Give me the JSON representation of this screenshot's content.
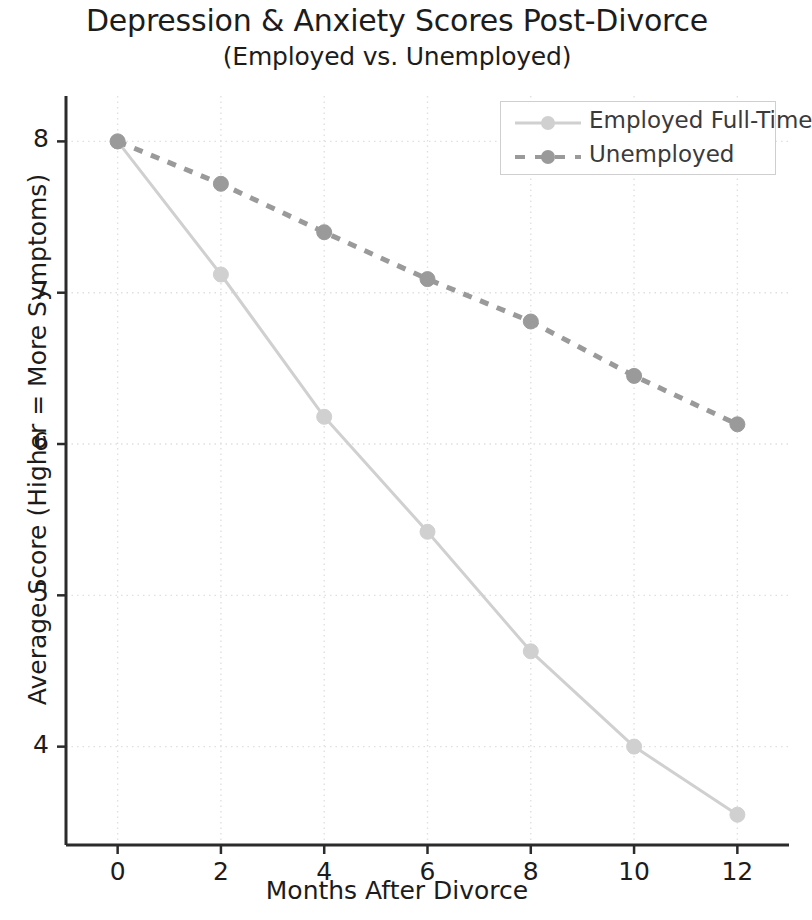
{
  "chart_data": {
    "type": "line",
    "title": "Depression & Anxiety Scores Post-Divorce",
    "subtitle": "(Employed vs. Unemployed)",
    "xlabel": "Months After Divorce",
    "ylabel": "Average Score (Higher = More Symptoms)",
    "x": [
      0,
      2,
      4,
      6,
      8,
      10,
      12
    ],
    "xticklabels": [
      "0",
      "2",
      "4",
      "6",
      "8",
      "10",
      "12"
    ],
    "yticklabels": [
      "4",
      "5",
      "6",
      "7",
      "8"
    ],
    "yticks": [
      4,
      5,
      6,
      7,
      8
    ],
    "xlim": [
      -1,
      13
    ],
    "ylim": [
      3.35,
      8.3
    ],
    "grid": true,
    "legend_position": "upper right",
    "series": [
      {
        "name": "Employed Full-Time",
        "values": [
          8.0,
          7.12,
          6.18,
          5.42,
          4.63,
          4.0,
          3.55
        ],
        "color": "#d0d0d0",
        "linestyle": "solid",
        "marker": "circle"
      },
      {
        "name": "Unemployed",
        "values": [
          8.0,
          7.72,
          7.4,
          7.09,
          6.81,
          6.45,
          6.13
        ],
        "color": "#9a9a9a",
        "linestyle": "dotted",
        "marker": "circle"
      }
    ],
    "colors": {
      "axis": "#2b2b2b",
      "grid": "#e0e0e0",
      "text": "#1c1c1c",
      "background": "#ffffff"
    }
  }
}
